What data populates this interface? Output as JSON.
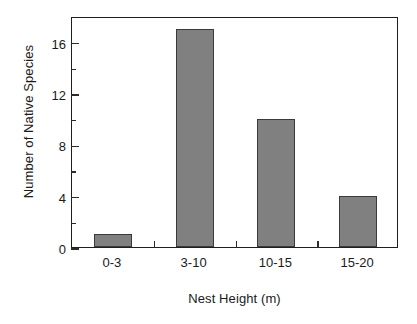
{
  "chart_data": {
    "type": "bar",
    "title": "",
    "xlabel": "Nest Height (m)",
    "ylabel": "Number of Native Species",
    "categories": [
      "0-3",
      "3-10",
      "10-15",
      "15-20"
    ],
    "values": [
      1,
      17,
      10,
      4
    ],
    "ylim": [
      0,
      18
    ],
    "ytick_major": [
      0,
      4,
      8,
      12,
      16
    ],
    "ytick_major_labels": [
      "0",
      "4",
      "8",
      "12",
      "16"
    ],
    "ytick_minor": [
      2,
      6,
      10,
      14
    ],
    "grid": "off",
    "legend": "none",
    "bar_color": "#808080",
    "bar_edge_color": "#3a3a3a",
    "axis_color": "#1f1f1f",
    "background_color": "#ffffff"
  }
}
